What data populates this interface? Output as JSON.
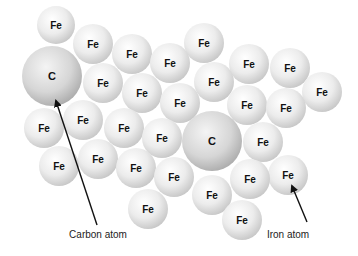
{
  "diagram": {
    "title": "",
    "colors": {
      "background": "#ffffff",
      "sphere_highlight": "#ffffff",
      "sphere_mid": "#ececec",
      "sphere_edge": "#c4c4c4",
      "carbon_highlight": "#f4f4f4",
      "carbon_mid": "#d6d6d6",
      "carbon_edge": "#a9a9a9",
      "label": "#111111",
      "arrow": "#111111"
    },
    "iron_atoms": [
      {
        "label": "Fe",
        "cx": 56,
        "cy": 25,
        "r": 19
      },
      {
        "label": "Fe",
        "cx": 93,
        "cy": 44,
        "r": 20
      },
      {
        "label": "Fe",
        "cx": 132,
        "cy": 54,
        "r": 20
      },
      {
        "label": "Fe",
        "cx": 170,
        "cy": 63,
        "r": 20
      },
      {
        "label": "Fe",
        "cx": 204,
        "cy": 43,
        "r": 20
      },
      {
        "label": "Fe",
        "cx": 249,
        "cy": 64,
        "r": 20
      },
      {
        "label": "Fe",
        "cx": 290,
        "cy": 68,
        "r": 20
      },
      {
        "label": "Fe",
        "cx": 322,
        "cy": 92,
        "r": 20
      },
      {
        "label": "Fe",
        "cx": 103,
        "cy": 83,
        "r": 20
      },
      {
        "label": "Fe",
        "cx": 142,
        "cy": 93,
        "r": 20
      },
      {
        "label": "Fe",
        "cx": 180,
        "cy": 103,
        "r": 20
      },
      {
        "label": "Fe",
        "cx": 214,
        "cy": 82,
        "r": 20
      },
      {
        "label": "Fe",
        "cx": 247,
        "cy": 105,
        "r": 20
      },
      {
        "label": "Fe",
        "cx": 286,
        "cy": 108,
        "r": 20
      },
      {
        "label": "Fe",
        "cx": 44,
        "cy": 128,
        "r": 20
      },
      {
        "label": "Fe",
        "cx": 83,
        "cy": 120,
        "r": 20
      },
      {
        "label": "Fe",
        "cx": 124,
        "cy": 128,
        "r": 20
      },
      {
        "label": "Fe",
        "cx": 162,
        "cy": 138,
        "r": 20
      },
      {
        "label": "Fe",
        "cx": 263,
        "cy": 142,
        "r": 20
      },
      {
        "label": "Fe",
        "cx": 59,
        "cy": 166,
        "r": 20
      },
      {
        "label": "Fe",
        "cx": 98,
        "cy": 159,
        "r": 20
      },
      {
        "label": "Fe",
        "cx": 136,
        "cy": 168,
        "r": 20
      },
      {
        "label": "Fe",
        "cx": 174,
        "cy": 177,
        "r": 20
      },
      {
        "label": "Fe",
        "cx": 212,
        "cy": 195,
        "r": 20
      },
      {
        "label": "Fe",
        "cx": 250,
        "cy": 179,
        "r": 20
      },
      {
        "label": "Fe",
        "cx": 288,
        "cy": 175,
        "r": 20
      },
      {
        "label": "Fe",
        "cx": 148,
        "cy": 209,
        "r": 20
      },
      {
        "label": "Fe",
        "cx": 242,
        "cy": 220,
        "r": 20
      }
    ],
    "carbon_atoms": [
      {
        "label": "C",
        "cx": 52,
        "cy": 76,
        "r": 30
      },
      {
        "label": "C",
        "cx": 212,
        "cy": 141,
        "r": 30
      }
    ],
    "annotations": [
      {
        "text": "Carbon atom",
        "x": 98,
        "y": 234,
        "arrow": {
          "x1": 97,
          "y1": 225,
          "x2": 56,
          "y2": 101
        }
      },
      {
        "text": "Iron atom",
        "x": 288,
        "y": 234,
        "arrow": {
          "x1": 307,
          "y1": 222,
          "x2": 292,
          "y2": 186
        }
      }
    ]
  }
}
